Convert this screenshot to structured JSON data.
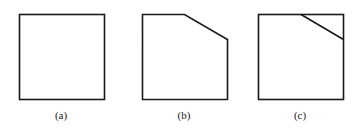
{
  "figure": {
    "panels": [
      {
        "id": "a",
        "label": "(a)",
        "description": "square",
        "label_x": 61
      },
      {
        "id": "b",
        "label": "(b)",
        "description": "square with top-right corner cut off (pentagon)",
        "label_x": 184
      },
      {
        "id": "c",
        "label": "(c)",
        "description": "square with a diagonal line across the top-right corner",
        "label_x": 300
      }
    ],
    "stroke_color": "#1a1a1a",
    "background_color": "#ffffff"
  }
}
